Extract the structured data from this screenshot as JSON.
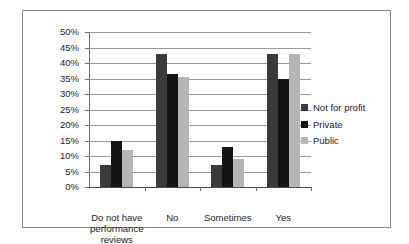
{
  "chart_data": {
    "type": "bar",
    "title": "",
    "xlabel": "",
    "ylabel": "",
    "categories": [
      "Do not have performance reviews",
      "No",
      "Sometimes",
      "Yes"
    ],
    "category_lines": [
      [
        "Do not have",
        "performance",
        "reviews"
      ],
      [
        "No"
      ],
      [
        "Sometimes"
      ],
      [
        "Yes"
      ]
    ],
    "series": [
      {
        "name": "Not for profit",
        "color": "#3a3a3a",
        "values": [
          7,
          43,
          7,
          43
        ]
      },
      {
        "name": "Private",
        "color": "#141414",
        "values": [
          15,
          36.5,
          13,
          35
        ]
      },
      {
        "name": "Public",
        "color": "#b5b5b5",
        "values": [
          12,
          35.5,
          9,
          43
        ]
      }
    ],
    "ylim": [
      0,
      50
    ],
    "ytick_step": 5,
    "ytick_labels": [
      "50%",
      "45%",
      "40%",
      "35%",
      "30%",
      "25%",
      "20%",
      "15%",
      "10%",
      "5%",
      "0%"
    ],
    "ytick_values": [
      50,
      45,
      40,
      35,
      30,
      25,
      20,
      15,
      10,
      5,
      0
    ],
    "grid": true,
    "legend_position": "right"
  },
  "frame": {
    "border_color": "#8a8a8a"
  }
}
